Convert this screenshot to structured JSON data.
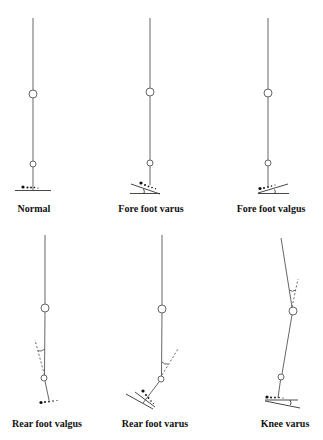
{
  "figure": {
    "panels": [
      {
        "id": "normal",
        "label": "Normal"
      },
      {
        "id": "fore-foot-varus",
        "label": "Fore foot varus"
      },
      {
        "id": "fore-foot-valgus",
        "label": "Fore foot valgus"
      },
      {
        "id": "rear-foot-valgus",
        "label": "Rear foot valgus"
      },
      {
        "id": "rear-foot-varus",
        "label": "Rear foot varus"
      },
      {
        "id": "knee-varus",
        "label": "Knee varus"
      }
    ],
    "colors": {
      "line": "#555555",
      "dot": "#111111",
      "background": "#ffffff"
    }
  }
}
